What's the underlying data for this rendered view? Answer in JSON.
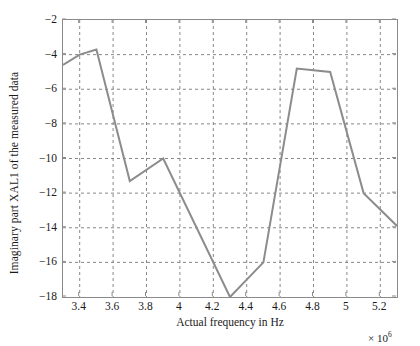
{
  "chart_data": {
    "type": "line",
    "title": "",
    "xlabel": "Actual frequency in Hz",
    "ylabel": "Imaginary part XAL1 of the measured data",
    "x_multiplier": "× 10",
    "x_multiplier_exp": "6",
    "xlim": [
      3.3,
      5.3
    ],
    "ylim": [
      -18,
      -2
    ],
    "xticks": [
      3.4,
      3.6,
      3.8,
      4,
      4.2,
      4.4,
      4.6,
      4.8,
      5,
      5.2
    ],
    "xtick_labels": [
      "3.4",
      "3.6",
      "3.8",
      "4",
      "4.2",
      "4.4",
      "4.6",
      "4.8",
      "5",
      "5.2"
    ],
    "yticks": [
      -2,
      -4,
      -6,
      -8,
      -10,
      -12,
      -14,
      -16,
      -18
    ],
    "ytick_labels": [
      "−2",
      "−4",
      "−6",
      "−8",
      "−10",
      "−12",
      "−14",
      "−16",
      "−18"
    ],
    "grid": true,
    "grid_style": "dashed",
    "legend": null,
    "line_color": "#8c8c8c",
    "line_width": 2,
    "series": [
      {
        "name": "Imaginary part XAL1",
        "x": [
          3.3,
          3.4,
          3.5,
          3.7,
          3.9,
          4.3,
          4.5,
          4.7,
          4.8,
          4.9,
          5.1,
          5.3
        ],
        "values": [
          -4.6,
          -4.0,
          -3.7,
          -11.3,
          -10.0,
          -18.0,
          -16.0,
          -4.8,
          -4.9,
          -5.0,
          -12.0,
          -13.9
        ]
      }
    ]
  },
  "axes": {
    "frame_color": "#8a8a8a",
    "grid_color": "#7a7a7a",
    "background": "#ffffff"
  }
}
